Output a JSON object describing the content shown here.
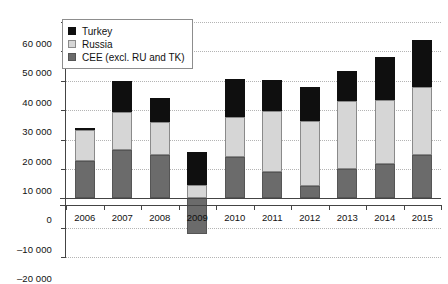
{
  "chart_data": {
    "type": "bar",
    "subtype": "stacked-bar",
    "title": "",
    "xlabel": "",
    "ylabel": "",
    "categories": [
      "2006",
      "2007",
      "2008",
      "2009",
      "2010",
      "2011",
      "2012",
      "2013",
      "2014",
      "2015"
    ],
    "series": [
      {
        "name": "CEE (excl. RU and TK)",
        "color": "#6b6b6b",
        "values": [
          12800,
          16400,
          14800,
          -12100,
          14200,
          9000,
          4200,
          9800,
          11800,
          14800
        ]
      },
      {
        "name": "Russia",
        "color": "#d6d6d6",
        "values": [
          10300,
          13100,
          11200,
          4500,
          13300,
          20800,
          22100,
          23400,
          21700,
          23200
        ]
      },
      {
        "name": "Turkey",
        "color": "#0f0f0f",
        "values": [
          900,
          10500,
          8000,
          11300,
          13000,
          10400,
          11500,
          10000,
          14500,
          16000
        ]
      }
    ],
    "totals_positive": [
      24000,
      40000,
      34000,
      15800,
      40500,
      40200,
      37800,
      43200,
      48000,
      54000
    ],
    "ylim": [
      -20000,
      60000
    ],
    "yticks": [
      -20000,
      -10000,
      0,
      10000,
      20000,
      30000,
      40000,
      50000,
      60000
    ],
    "ytick_labels": [
      "–20 000",
      "–10 000",
      "0",
      "10 000",
      "20 000",
      "30 000",
      "40 000",
      "50 000",
      "60 000"
    ],
    "grid": true,
    "grid_style": "dotted-horizontal",
    "legend_position": "top-left-inside"
  },
  "legend": {
    "items": [
      {
        "label": "Turkey",
        "swatch": "swatch-black"
      },
      {
        "label": "Russia",
        "swatch": "swatch-light-grey"
      },
      {
        "label": "CEE (excl. RU and TK)",
        "swatch": "swatch-dark-grey"
      }
    ]
  },
  "colors": {
    "turkey": "#0f0f0f",
    "russia": "#d6d6d6",
    "cee": "#6b6b6b",
    "gridline": "#b4b4b4",
    "axis": "#444444",
    "background": "#ffffff"
  }
}
